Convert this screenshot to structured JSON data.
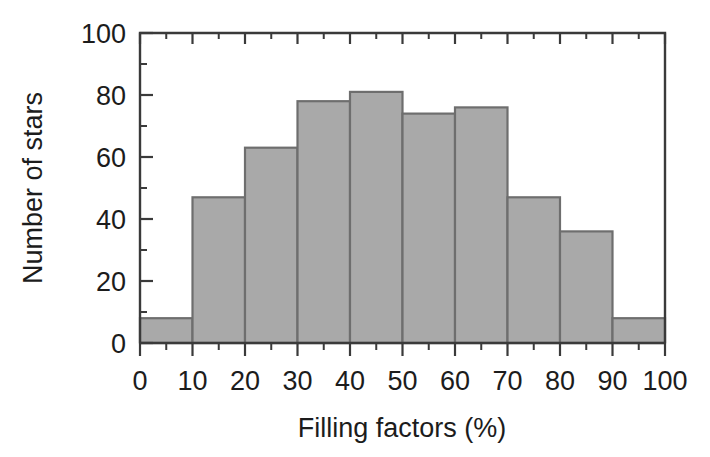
{
  "chart_data": {
    "type": "bar",
    "title": "",
    "subtitle": "",
    "xlabel": "Filling factors (%)",
    "ylabel": "Number of stars",
    "categories": [
      "0-10",
      "10-20",
      "20-30",
      "30-40",
      "40-50",
      "50-60",
      "60-70",
      "70-80",
      "80-90",
      "90-100"
    ],
    "bin_edges": [
      0,
      10,
      20,
      30,
      40,
      50,
      60,
      70,
      80,
      90,
      100
    ],
    "values": [
      8,
      47,
      63,
      78,
      81,
      74,
      76,
      47,
      36,
      8
    ],
    "xlim": [
      0,
      100
    ],
    "ylim": [
      0,
      100
    ],
    "x_major_ticks": [
      0,
      10,
      20,
      30,
      40,
      50,
      60,
      70,
      80,
      90,
      100
    ],
    "x_tick_labels": [
      "0",
      "10",
      "20",
      "30",
      "40",
      "50",
      "60",
      "70",
      "80",
      "90",
      "100"
    ],
    "x_minor_ticks": [
      5,
      15,
      25,
      35,
      45,
      55,
      65,
      75,
      85,
      95
    ],
    "y_major_ticks": [
      0,
      20,
      40,
      60,
      80,
      100
    ],
    "y_tick_labels": [
      "0",
      "20",
      "40",
      "60",
      "80",
      "100"
    ],
    "y_minor_ticks": [
      10,
      30,
      50,
      70,
      90
    ],
    "grid": false,
    "legend": null,
    "colors": {
      "bar_fill": "#a9a9a9",
      "bar_edge": "#6e6e6e",
      "axis": "#3a3a3a",
      "text": "#1c1c1c",
      "background": "#ffffff"
    }
  }
}
